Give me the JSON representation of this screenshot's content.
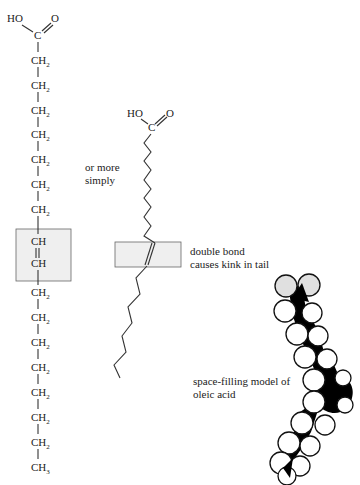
{
  "structural_formula": {
    "head": {
      "hydroxyl": "HO",
      "carbon": "C",
      "oxygen": "O"
    },
    "chain": [
      {
        "atom": "CH",
        "sub": "2"
      },
      {
        "atom": "CH",
        "sub": "2"
      },
      {
        "atom": "CH",
        "sub": "2"
      },
      {
        "atom": "CH",
        "sub": "2"
      },
      {
        "atom": "CH",
        "sub": "2"
      },
      {
        "atom": "CH",
        "sub": "2"
      },
      {
        "atom": "CH",
        "sub": "2"
      },
      {
        "atom": "CH",
        "sub": ""
      },
      {
        "atom": "CH",
        "sub": ""
      },
      {
        "atom": "CH",
        "sub": "2"
      },
      {
        "atom": "CH",
        "sub": "2"
      },
      {
        "atom": "CH",
        "sub": "2"
      },
      {
        "atom": "CH",
        "sub": "2"
      },
      {
        "atom": "CH",
        "sub": "2"
      },
      {
        "atom": "CH",
        "sub": "2"
      },
      {
        "atom": "CH",
        "sub": "2"
      },
      {
        "atom": "CH",
        "sub": "3"
      }
    ]
  },
  "skeletal_formula": {
    "hydroxyl": "HO",
    "carbon": "C",
    "oxygen": "O",
    "label_line1": "or more",
    "label_line2": "simply"
  },
  "double_bond_note": {
    "line1": "double bond",
    "line2": "causes kink in tail"
  },
  "space_filling": {
    "line1": "space-filling model of",
    "line2": "oleic acid"
  },
  "colors": {
    "highlight": "#efefef",
    "ink": "#222222",
    "carbon_fill": "#000000",
    "oxygen_fill": "#e0e0e0"
  }
}
